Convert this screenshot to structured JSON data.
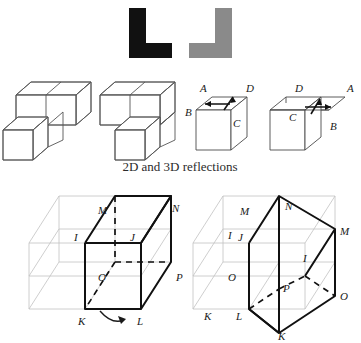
{
  "figure": {
    "caption": "2D and 3D reflections",
    "colors": {
      "black_shape": "#111111",
      "gray_shape": "#8a8a8a",
      "line": "#3a3a3a",
      "faint_line": "#b9b9b9",
      "bold_line": "#111111",
      "background": "#ffffff",
      "text": "#1a1a1a"
    },
    "panels": [
      {
        "name": "2d-reflection-pair",
        "kind": "2d",
        "items": [
          {
            "name": "black-L-shape",
            "color": "#111111",
            "orientation": "L"
          },
          {
            "name": "gray-L-shape",
            "color": "#8a8a8a",
            "orientation": "mirrored-L"
          }
        ]
      },
      {
        "name": "cube-stack-pair",
        "kind": "3d-blocks",
        "items": [
          {
            "name": "cube-stack-original",
            "cubes": 3,
            "orientation": "original"
          },
          {
            "name": "cube-stack-mirrored",
            "cubes": 3,
            "orientation": "mirrored"
          }
        ]
      },
      {
        "name": "labelled-cube-pair",
        "kind": "3d-cube-with-arrow",
        "items": [
          {
            "name": "labelled-cube-original",
            "arrow_direction": "left",
            "vertex_labels": [
              {
                "id": "A",
                "text": "A"
              },
              {
                "id": "B",
                "text": "B"
              },
              {
                "id": "C",
                "text": "C"
              },
              {
                "id": "D",
                "text": "D"
              }
            ]
          },
          {
            "name": "labelled-cube-mirrored",
            "arrow_direction": "right",
            "vertex_labels": [
              {
                "id": "D",
                "text": "D"
              },
              {
                "id": "A",
                "text": "A"
              },
              {
                "id": "C",
                "text": "C"
              },
              {
                "id": "B",
                "text": "B"
              }
            ]
          }
        ]
      },
      {
        "name": "wireframe-prism-pair",
        "kind": "3d-wireframe",
        "items": [
          {
            "name": "wireframe-prism-original",
            "rotation_arrow": "clockwise",
            "vertex_labels": [
              {
                "id": "M",
                "text": "M"
              },
              {
                "id": "N",
                "text": "N"
              },
              {
                "id": "I",
                "text": "I"
              },
              {
                "id": "J",
                "text": "J"
              },
              {
                "id": "O",
                "text": "O"
              },
              {
                "id": "P",
                "text": "P"
              },
              {
                "id": "K",
                "text": "K"
              },
              {
                "id": "L",
                "text": "L"
              }
            ]
          },
          {
            "name": "wireframe-prism-rotated",
            "rotation_arrow": "none",
            "vertex_labels": [
              {
                "id": "M_ghost",
                "text": "M"
              },
              {
                "id": "I_ghost",
                "text": "I"
              },
              {
                "id": "O_ghost",
                "text": "O"
              },
              {
                "id": "K_ghost",
                "text": "K"
              },
              {
                "id": "N",
                "text": "N"
              },
              {
                "id": "M",
                "text": "M"
              },
              {
                "id": "J",
                "text": "J"
              },
              {
                "id": "I",
                "text": "I"
              },
              {
                "id": "P",
                "text": "P"
              },
              {
                "id": "O",
                "text": "O"
              },
              {
                "id": "L",
                "text": "L"
              },
              {
                "id": "K",
                "text": "K"
              }
            ]
          }
        ]
      }
    ]
  }
}
